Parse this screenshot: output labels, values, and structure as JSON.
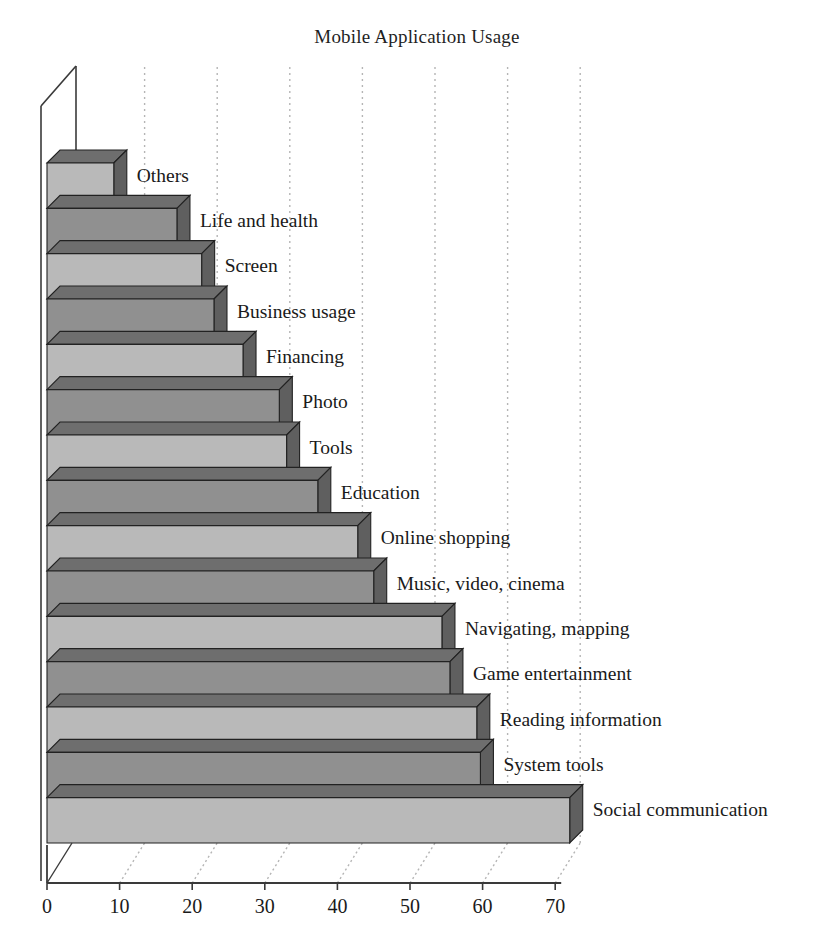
{
  "chart_data": {
    "type": "bar",
    "orientation": "horizontal",
    "style": "3d",
    "title": "Mobile Application Usage",
    "xlabel": "",
    "ylabel": "",
    "xlim": [
      0,
      73
    ],
    "xticks": [
      0,
      10,
      20,
      30,
      40,
      50,
      60,
      70
    ],
    "xtick_labels": [
      "0",
      "10",
      "20",
      "30",
      "40",
      "50",
      "60",
      "70"
    ],
    "grid": true,
    "grid_style": "dotted",
    "legend": false,
    "categories": [
      "Others",
      "Life and health",
      "Screen",
      "Business usage",
      "Financing",
      "Photo",
      "Tools",
      "Education",
      "Online shopping",
      "Music, video, cinema",
      "Navigating, mapping",
      "Game entertainment",
      "Reading information",
      "System tools",
      "Social communication"
    ],
    "values": [
      9.2,
      17.9,
      21.3,
      23.0,
      27.0,
      32.0,
      33.0,
      37.3,
      42.8,
      45.0,
      54.4,
      55.5,
      59.2,
      59.7,
      72.0
    ],
    "colors": {
      "bar_light_front": "#b9b9b9",
      "bar_dark_front": "#909090",
      "bar_top": "#6e6e6e",
      "bar_side": "#5f5f5f",
      "bar_outline": "#222222",
      "axis": "#3a3a3a",
      "grid": "#b5b5b5",
      "text": "#1a1a1a",
      "background": "#ffffff"
    }
  }
}
